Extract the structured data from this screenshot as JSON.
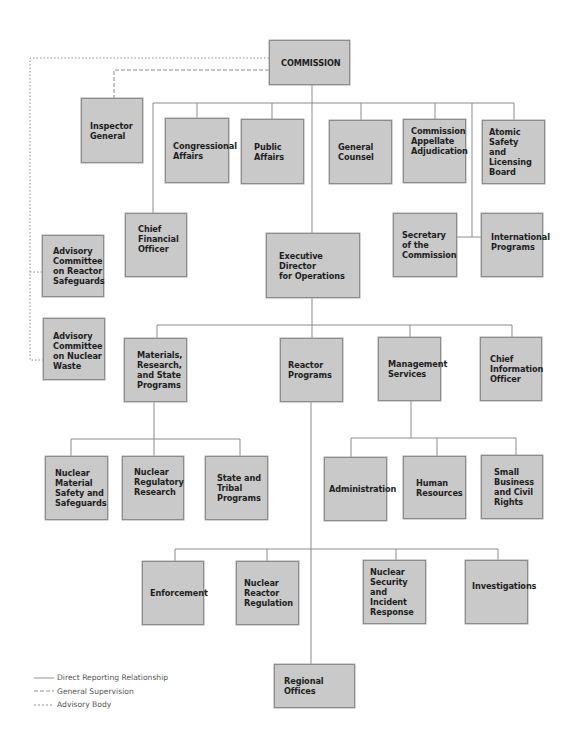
{
  "chart_title": "",
  "colors": {
    "box_fill": "#c9c9c9",
    "box_border": "#8c8c8c",
    "line": "#8c8c8c",
    "text": "#1e1e1e",
    "legend_text": "#555555"
  },
  "nodes": {
    "commission": "COMMISSION",
    "inspector_general": "Inspector\nGeneral",
    "congressional_affairs": "Congressional\nAffairs",
    "public_affairs": "Public\nAffairs",
    "general_counsel": "General\nCounsel",
    "commission_appellate_adjudication": "Commission\nAppellate\nAdjudication",
    "atomic_safety_licensing_board": "Atomic Safety\nand\nLicensing\nBoard",
    "chief_financial_officer": "Chief\nFinancial\nOfficer",
    "executive_director_operations": "Executive Director\nfor Operations",
    "secretary_of_commission": "Secretary\nof the\nCommission",
    "international_programs": "International\nPrograms",
    "acrs": "Advisory\nCommittee\non Reactor\nSafeguards",
    "acnw": "Advisory\nCommittee\non Nuclear\nWaste",
    "materials_research_state": "Materials,\nResearch,\nand State\nPrograms",
    "reactor_programs": "Reactor\nPrograms",
    "management_services": "Management\nServices",
    "chief_information_officer": "Chief\nInformation\nOfficer",
    "nmss": "Nuclear\nMaterial\nSafety and\nSafeguards",
    "nuclear_regulatory_research": "Nuclear\nRegulatory\nResearch",
    "state_tribal_programs": "State and\nTribal\nPrograms",
    "administration": "Administration",
    "human_resources": "Human\nResources",
    "small_business_civil_rights": "Small\nBusiness\nand Civil\nRights",
    "enforcement": "Enforcement",
    "nuclear_reactor_regulation": "Nuclear\nReactor\nRegulation",
    "nsir": "Nuclear\nSecurity and\nIncident\nResponse",
    "investigations": "Investigations",
    "regional_offices": "Regional\nOffices"
  },
  "relationships": [
    {
      "from": "commission",
      "to": "inspector_general",
      "type": "general_supervision"
    },
    {
      "from": "commission",
      "to": "acrs",
      "type": "advisory"
    },
    {
      "from": "commission",
      "to": "acnw",
      "type": "advisory"
    },
    {
      "from": "commission",
      "to": "congressional_affairs",
      "type": "direct"
    },
    {
      "from": "commission",
      "to": "public_affairs",
      "type": "direct"
    },
    {
      "from": "commission",
      "to": "general_counsel",
      "type": "direct"
    },
    {
      "from": "commission",
      "to": "commission_appellate_adjudication",
      "type": "direct"
    },
    {
      "from": "commission",
      "to": "atomic_safety_licensing_board",
      "type": "direct"
    },
    {
      "from": "commission",
      "to": "chief_financial_officer",
      "type": "direct"
    },
    {
      "from": "commission",
      "to": "executive_director_operations",
      "type": "direct"
    },
    {
      "from": "commission",
      "to": "secretary_of_commission",
      "type": "direct"
    },
    {
      "from": "commission",
      "to": "international_programs",
      "type": "direct"
    },
    {
      "from": "executive_director_operations",
      "to": "materials_research_state",
      "type": "direct"
    },
    {
      "from": "executive_director_operations",
      "to": "reactor_programs",
      "type": "direct"
    },
    {
      "from": "executive_director_operations",
      "to": "management_services",
      "type": "direct"
    },
    {
      "from": "executive_director_operations",
      "to": "chief_information_officer",
      "type": "direct"
    },
    {
      "from": "materials_research_state",
      "to": "nmss",
      "type": "direct"
    },
    {
      "from": "materials_research_state",
      "to": "nuclear_regulatory_research",
      "type": "direct"
    },
    {
      "from": "materials_research_state",
      "to": "state_tribal_programs",
      "type": "direct"
    },
    {
      "from": "management_services",
      "to": "administration",
      "type": "direct"
    },
    {
      "from": "management_services",
      "to": "human_resources",
      "type": "direct"
    },
    {
      "from": "management_services",
      "to": "small_business_civil_rights",
      "type": "direct"
    },
    {
      "from": "reactor_programs",
      "to": "enforcement",
      "type": "direct"
    },
    {
      "from": "reactor_programs",
      "to": "nuclear_reactor_regulation",
      "type": "direct"
    },
    {
      "from": "reactor_programs",
      "to": "nsir",
      "type": "direct"
    },
    {
      "from": "reactor_programs",
      "to": "investigations",
      "type": "direct"
    },
    {
      "from": "reactor_programs",
      "to": "regional_offices",
      "type": "direct"
    }
  ],
  "legend": {
    "direct": "Direct Reporting Relationship",
    "general_supervision": "General Supervision",
    "advisory": "Advisory Body"
  }
}
